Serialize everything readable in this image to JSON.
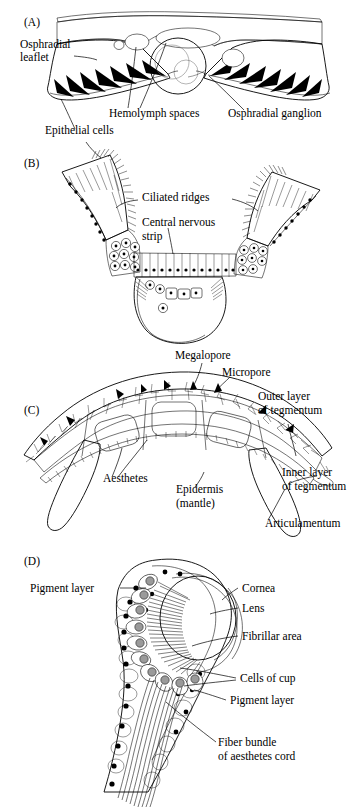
{
  "figure": {
    "background_color": "#ffffff",
    "ink_color": "#000000",
    "panels": [
      {
        "letter": "(A)",
        "subject": "Cross section through an osphradium showing osphradial leaflets and ganglion",
        "labels": [
          {
            "id": "osphradial-leaflet",
            "text": "Osphradial\nleaflet",
            "lines": [
              "Osphradial",
              "leaflet"
            ]
          },
          {
            "id": "epithelial-cells",
            "text": "Epithelial cells",
            "lines": [
              "Epithelial cells"
            ]
          },
          {
            "id": "hemolymph-spaces",
            "text": "Hemolymph spaces",
            "lines": [
              "Hemolymph spaces"
            ]
          },
          {
            "id": "osphradial-ganglion",
            "text": "Osphradial ganglion",
            "lines": [
              "Osphradial ganglion"
            ]
          }
        ]
      },
      {
        "letter": "(B)",
        "subject": "Detail of osphradial epithelium with ciliated ridges and central nervous strip",
        "labels": [
          {
            "id": "ciliated-ridges",
            "text": "Ciliated ridges",
            "lines": [
              "Ciliated ridges"
            ]
          },
          {
            "id": "central-nervous-strip",
            "text": "Central nervous strip",
            "lines": [
              "Central nervous",
              "strip"
            ]
          }
        ]
      },
      {
        "letter": "(C)",
        "subject": "Section through a chiton shell plate showing aesthetes and tegmentum layers",
        "labels": [
          {
            "id": "megalopore",
            "text": "Megalopore",
            "lines": [
              "Megalopore"
            ]
          },
          {
            "id": "micropore",
            "text": "Micropore",
            "lines": [
              "Micropore"
            ]
          },
          {
            "id": "outer-layer-of-tegmentum",
            "text": "Outer layer of tegmentum",
            "lines": [
              "Outer layer",
              "of tegmentum"
            ]
          },
          {
            "id": "inner-layer-of-tegmentum",
            "text": "Inner layer of tegmentum",
            "lines": [
              "Inner layer",
              "of tegmentum"
            ]
          },
          {
            "id": "aesthetes",
            "text": "Aesthetes",
            "lines": [
              "Aesthetes"
            ]
          },
          {
            "id": "epidermis-mantle",
            "text": "Epidermis (mantle)",
            "lines": [
              "Epidermis",
              "(mantle)"
            ]
          },
          {
            "id": "articulamentum",
            "text": "Articulamentum",
            "lines": [
              "Articulamentum"
            ]
          }
        ]
      },
      {
        "letter": "(D)",
        "subject": "Longitudinal section of a chiton shell eye (ocellus)",
        "labels": [
          {
            "id": "pigment-layer-upper",
            "text": "Pigment layer",
            "lines": [
              "Pigment layer"
            ]
          },
          {
            "id": "cornea",
            "text": "Cornea",
            "lines": [
              "Cornea"
            ]
          },
          {
            "id": "lens",
            "text": "Lens",
            "lines": [
              "Lens"
            ]
          },
          {
            "id": "fibrillar-area",
            "text": "Fibrillar area",
            "lines": [
              "Fibrillar area"
            ]
          },
          {
            "id": "cells-of-cup",
            "text": "Cells of cup",
            "lines": [
              "Cells of cup"
            ]
          },
          {
            "id": "pigment-layer-lower",
            "text": "Pigment layer",
            "lines": [
              "Pigment layer"
            ]
          },
          {
            "id": "fiber-bundle-of-aesthetes-cord",
            "text": "Fiber bundle of aesthetes cord",
            "lines": [
              "Fiber bundle",
              "of aesthetes cord"
            ]
          }
        ]
      }
    ]
  }
}
